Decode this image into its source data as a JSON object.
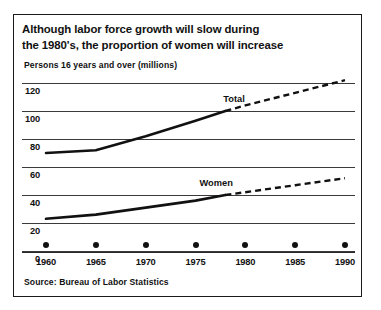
{
  "figure": {
    "title_line1": "Although labor force growth will slow during",
    "title_line2": "the 1980's, the proportion of women will increase",
    "subtitle": "Persons 16 years and over (millions)",
    "source": "Source:  Bureau of Labor Statistics"
  },
  "chart_data": {
    "type": "line",
    "title": "Although labor force growth will slow during the 1980's, the proportion of women will increase",
    "subtitle": "Persons 16 years and over (millions)",
    "xlabel": "",
    "ylabel": "Persons 16 years and over (millions)",
    "xlim": [
      1960,
      1990
    ],
    "ylim": [
      0,
      120
    ],
    "yticks": [
      0,
      20,
      40,
      60,
      80,
      100,
      120
    ],
    "xticks": [
      1960,
      1965,
      1970,
      1975,
      1980,
      1985,
      1990
    ],
    "grid": true,
    "legend": "inline-labels",
    "projection_start_year": 1978,
    "series": [
      {
        "name": "Total",
        "label": "Total",
        "x": [
          1960,
          1965,
          1970,
          1975,
          1978,
          1980,
          1985,
          1990
        ],
        "values": [
          70,
          72,
          82,
          93,
          100,
          104,
          113,
          122
        ],
        "actual_through": 1978
      },
      {
        "name": "Women",
        "label": "Women",
        "x": [
          1960,
          1965,
          1970,
          1975,
          1978,
          1980,
          1985,
          1990
        ],
        "values": [
          23,
          26,
          31,
          36,
          40,
          42,
          47,
          52
        ],
        "actual_through": 1978
      }
    ]
  },
  "axes": {
    "y_tick_labels": [
      "120",
      "100",
      "80",
      "60",
      "40",
      "20",
      "0"
    ],
    "x_tick_labels": [
      "1960",
      "1965",
      "1970",
      "1975",
      "1980",
      "1985",
      "1990"
    ]
  },
  "series_labels": {
    "total": "Total",
    "women": "Women"
  },
  "colors": {
    "line": "#111111",
    "grid": "#3a3a3a",
    "background": "#ffffff"
  }
}
